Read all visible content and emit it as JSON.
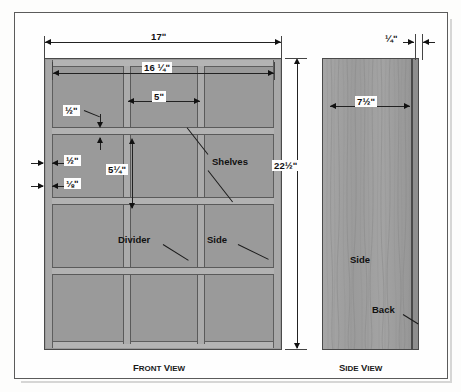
{
  "drawing": {
    "front_view": {
      "title_first": "F",
      "title_rest": "RONT ",
      "title_second": "V",
      "title_rest2": "IEW",
      "dimensions": {
        "overall_width": "17ʺ",
        "inner_width": "16 ¼ʺ",
        "bay_width": "5ʺ",
        "shelf_thickness_top": "½ʺ",
        "side_thickness": "½ʺ",
        "back_thickness": "⅛ʺ",
        "bay_height": "5¼ʺ"
      },
      "callouts": {
        "shelves": "Shelves",
        "divider": "Divider",
        "side": "Side"
      }
    },
    "side_view": {
      "title_first": "S",
      "title_rest": "IDE ",
      "title_second": "V",
      "title_rest2": "IEW",
      "dimensions": {
        "height": "22½ʺ",
        "depth": "7½ʺ",
        "back_thickness": "¼ʺ"
      },
      "callouts": {
        "side": "Side",
        "back": "Back"
      }
    }
  },
  "colors": {
    "panel_fill": "#9a9a9a",
    "shelf_fill": "#b2b2b2",
    "line": "#4a4a4a",
    "text": "#111111",
    "paper": "#fefefe"
  }
}
